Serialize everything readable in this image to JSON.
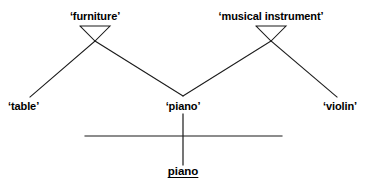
{
  "diagram": {
    "type": "semantic-feature-tree",
    "sense_nodes": [
      {
        "id": "furniture",
        "label": "‘furniture’",
        "x": 95,
        "y": 20,
        "triangle": {
          "left_x": 80,
          "right_x": 110,
          "top_y": 26,
          "apex_x": 95,
          "apex_y": 41
        }
      },
      {
        "id": "musical-instrument",
        "label": "‘musical instrument’",
        "x": 271,
        "y": 20,
        "triangle": {
          "left_x": 256,
          "right_x": 286,
          "top_y": 26,
          "apex_x": 271,
          "apex_y": 41
        }
      }
    ],
    "leaf_nodes": [
      {
        "id": "table",
        "label": "‘table’",
        "x": 30,
        "y": 108,
        "anchor": "left"
      },
      {
        "id": "piano",
        "label": "‘piano’",
        "x": 183,
        "y": 108,
        "anchor": "center"
      },
      {
        "id": "violin",
        "label": "‘violin’",
        "x": 337,
        "y": 108,
        "anchor": "right"
      }
    ],
    "edges": [
      {
        "from": "furniture-apex",
        "to": "table",
        "x1": 95,
        "y1": 41,
        "x2": 30,
        "y2": 97
      },
      {
        "from": "furniture-apex",
        "to": "piano",
        "x1": 95,
        "y1": 41,
        "x2": 183,
        "y2": 96
      },
      {
        "from": "musical-apex",
        "to": "piano",
        "x1": 271,
        "y1": 41,
        "x2": 183,
        "y2": 96
      },
      {
        "from": "musical-apex",
        "to": "violin",
        "x1": 271,
        "y1": 41,
        "x2": 337,
        "y2": 97
      }
    ],
    "word_level": {
      "separator_line": {
        "x1": 85,
        "x2": 282,
        "y": 136
      },
      "stem_line": {
        "x": 183,
        "y1": 114,
        "y2": 165
      },
      "word_form": {
        "id": "piano-word",
        "label": "piano",
        "x": 183,
        "y": 166
      }
    },
    "stroke_color": "#1a1a1a",
    "background_color": "#ffffff"
  }
}
